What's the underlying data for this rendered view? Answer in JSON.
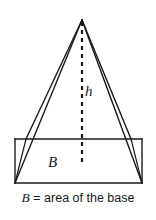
{
  "figure": {
    "type": "geometry-diagram",
    "background_color": "#ffffff",
    "stroke_color": "#1a1a1a",
    "labels": {
      "height": "h",
      "base": "B"
    },
    "caption": {
      "variable": "B",
      "text": " = area of the base",
      "full": "B = area of the base"
    },
    "geometry": {
      "apex": [
        82,
        20
      ],
      "base_front_left": [
        15,
        183
      ],
      "base_front_right": [
        142,
        183
      ],
      "base_back_left": [
        25,
        139
      ],
      "base_back_right": [
        142,
        139
      ],
      "height_line_start": [
        82,
        20
      ],
      "height_line_end": [
        82,
        163
      ],
      "height_line_style": "dashed"
    }
  }
}
